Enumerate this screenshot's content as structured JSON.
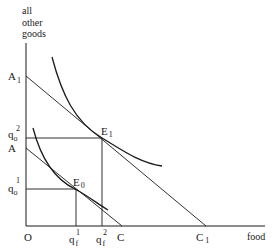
{
  "diagram": {
    "type": "indifference-curve-budget-constraint",
    "y_axis_label_lines": [
      "all",
      "other",
      "goods"
    ],
    "x_axis_label": "food",
    "origin_label": "O",
    "y_axis_points": {
      "A1": {
        "main": "A",
        "sub": "1"
      },
      "q2": {
        "main": "q",
        "sub": "o",
        "sup": "2"
      },
      "A": {
        "main": "A"
      },
      "q1": {
        "main": "q",
        "sub": "o",
        "sup": "1"
      }
    },
    "x_axis_points": {
      "qf1": {
        "main": "q",
        "sub": "f",
        "sup": "1"
      },
      "qf2": {
        "main": "q",
        "sub": "f",
        "sup": "2"
      },
      "C": {
        "main": "C"
      },
      "C1": {
        "main": "C",
        "sub": "1"
      }
    },
    "equilibria": {
      "E0": {
        "main": "E",
        "sub": "0"
      },
      "E1": {
        "main": "E",
        "sub": "1"
      }
    },
    "line_color": "#1a1a1a"
  }
}
